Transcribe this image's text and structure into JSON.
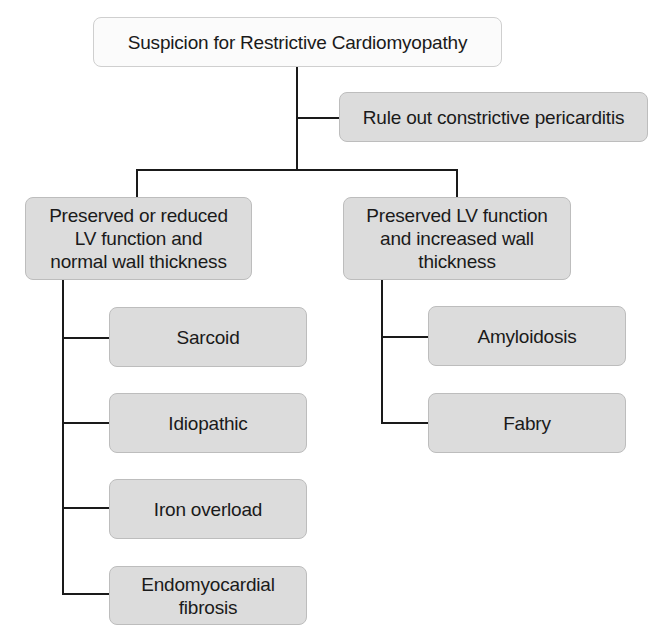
{
  "diagram": {
    "type": "flowchart",
    "root": {
      "label": "Suspicion for Restrictive Cardiomyopathy"
    },
    "side_step": {
      "label": "Rule out constrictive pericarditis"
    },
    "branches": [
      {
        "label": "Preserved or reduced\nLV function and\nnormal wall thickness",
        "children": [
          {
            "label": "Sarcoid"
          },
          {
            "label": "Idiopathic"
          },
          {
            "label": "Iron overload"
          },
          {
            "label": "Endomyocardial\nfibrosis"
          }
        ]
      },
      {
        "label": "Preserved LV function\nand increased wall\nthickness",
        "children": [
          {
            "label": "Amyloidosis"
          },
          {
            "label": "Fabry"
          }
        ]
      }
    ]
  },
  "colors": {
    "root_fill": "#fbfbfb",
    "node_fill": "#dcdcdc",
    "line": "#1a1a1a",
    "text": "#1a1a1a"
  }
}
